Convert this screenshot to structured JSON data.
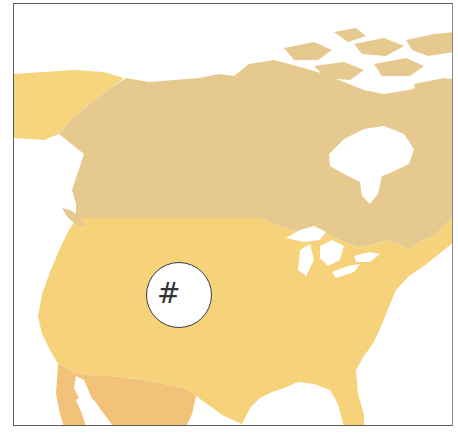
{
  "map": {
    "region": "North America",
    "regions": [
      {
        "name": "Alaska",
        "color": "#f7d57e"
      },
      {
        "name": "Canada",
        "color": "#e6c98f"
      },
      {
        "name": "United States",
        "color": "#f6d27a"
      },
      {
        "name": "Mexico",
        "color": "#f2c27a"
      }
    ],
    "water_color": "#ffffff",
    "border_color": "#5a5a5a"
  },
  "label": {
    "symbol": "#",
    "location": "United States"
  }
}
